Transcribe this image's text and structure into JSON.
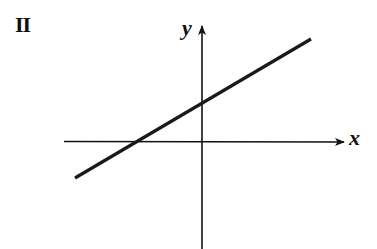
{
  "figure": {
    "panel_label": "II",
    "x_axis_label": "x",
    "y_axis_label": "y",
    "colors": {
      "ink": "#111111",
      "background": "#ffffff"
    },
    "geometry": {
      "origin_px": [
        202,
        142
      ],
      "x_axis": {
        "from_px": [
          64,
          142
        ],
        "to_px": [
          345,
          142
        ],
        "arrow": "right"
      },
      "y_axis": {
        "from_px": [
          202,
          249
        ],
        "to_px": [
          202,
          25
        ],
        "arrow": "up"
      },
      "line": {
        "from_px": [
          75,
          178
        ],
        "to_px": [
          311,
          39
        ],
        "x_intercept_px": [
          134,
          142
        ],
        "y_intercept_px": [
          202,
          103
        ],
        "slope_sign": "positive",
        "y_intercept_sign": "positive",
        "x_intercept_sign": "negative"
      }
    }
  }
}
